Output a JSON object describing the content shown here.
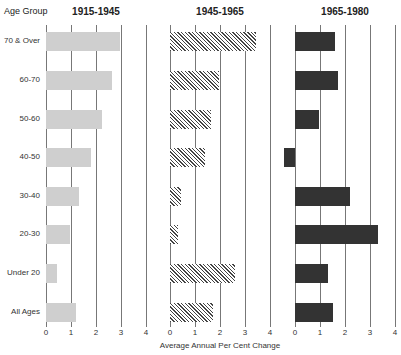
{
  "chart_data": {
    "type": "bar",
    "orientation": "horizontal",
    "ylabel": "Age Group",
    "xlabel": "Average Annual Per Cent Change",
    "categories": [
      "70 & Over",
      "60-70",
      "50-60",
      "40-50",
      "30-40",
      "20-30",
      "Under 20",
      "All Ages"
    ],
    "xlim": [
      0,
      4
    ],
    "xticks": [
      "0",
      "1",
      "2",
      "3",
      "4"
    ],
    "grid": true,
    "panels": [
      {
        "title": "1915-1945",
        "values": [
          2.95,
          2.65,
          2.25,
          1.8,
          1.3,
          0.95,
          0.45,
          1.2
        ]
      },
      {
        "title": "1945-1965",
        "values": [
          3.45,
          1.95,
          1.65,
          1.4,
          0.45,
          0.3,
          2.6,
          1.7
        ]
      },
      {
        "title": "1965-1980",
        "values": [
          1.6,
          1.7,
          0.95,
          -0.45,
          2.2,
          3.3,
          1.3,
          1.5
        ]
      }
    ]
  }
}
